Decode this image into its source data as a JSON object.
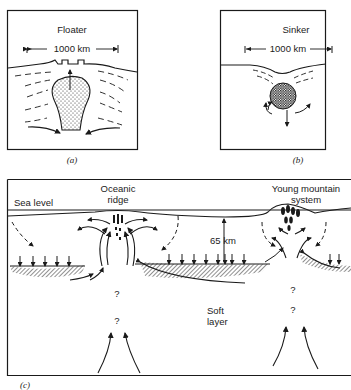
{
  "panels": {
    "a": {
      "title": "Floater",
      "scale_label": "1000 km",
      "caption": "(a)"
    },
    "b": {
      "title": "Sinker",
      "scale_label": "1000 km",
      "caption": "(b)"
    },
    "c": {
      "sea_level_label": "Sea level",
      "ridge_label_line1": "Oceanic",
      "ridge_label_line2": "ridge",
      "mountain_label_line1": "Young mountain",
      "mountain_label_line2": "system",
      "depth_label": "65 km",
      "soft_layer_line1": "Soft",
      "soft_layer_line2": "layer",
      "unknown_marks": [
        "?",
        "?",
        "?",
        "?"
      ],
      "caption": "(c)"
    }
  },
  "colors": {
    "ink": "#1a1a1a",
    "background": "#ffffff"
  }
}
